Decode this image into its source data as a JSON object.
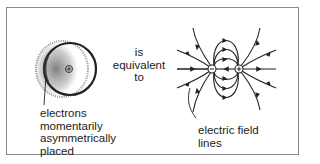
{
  "left_panel": {
    "label_lines": [
      "electrons",
      "momentarily",
      "asymmetrically",
      "placed"
    ],
    "nucleus_symbol": "+"
  },
  "middle": {
    "lines": [
      "is",
      "equivalent",
      "to"
    ]
  },
  "right_panel": {
    "label_lines": [
      "electric field",
      "lines"
    ],
    "negative_symbol": "−",
    "positive_symbol": "+"
  },
  "colors": {
    "ink": "#222222",
    "frame": "#8a8a8a",
    "stipple": "#555555"
  }
}
